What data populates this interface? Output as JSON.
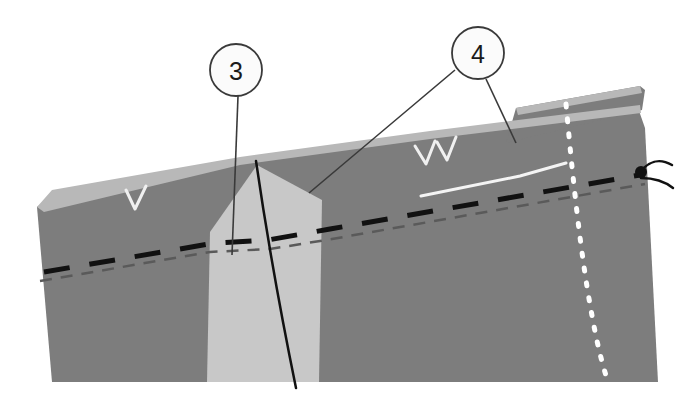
{
  "figure": {
    "type": "geological-cross-section-illustration",
    "background_color": "#ffffff",
    "width": 693,
    "height": 403
  },
  "callouts": [
    {
      "id": "callout-3",
      "label": "3",
      "circle": {
        "cx": 236,
        "cy": 70,
        "r": 26
      },
      "stroke": "#3a3a3a",
      "fill": "#fbfbfb",
      "leaders": [
        {
          "x1": 238,
          "y1": 96,
          "x2": 232,
          "y2": 255
        }
      ]
    },
    {
      "id": "callout-4",
      "label": "4",
      "circle": {
        "cx": 478,
        "cy": 53,
        "r": 26
      },
      "stroke": "#3a3a3a",
      "fill": "#fbfbfb",
      "leaders": [
        {
          "x1": 455,
          "y1": 70,
          "x2": 309,
          "y2": 193
        },
        {
          "x1": 486,
          "y1": 79,
          "x2": 516,
          "y2": 143
        }
      ]
    }
  ],
  "layers": [
    {
      "name": "main-rock-body",
      "color": "#7d7d7d",
      "points": "37,207 55,193 238,160 430,134 638,108 645,128 658,382 118,382 52,382"
    },
    {
      "name": "upper-detached-slab",
      "color": "#7d7d7d",
      "points": "506,143 642,110 645,90 640,86 516,108"
    },
    {
      "name": "top-weathered-crust-main",
      "color": "#b8b8b8",
      "points": "37,207 52,190 240,157 430,131 640,105 641,113 430,139 240,165 44,212"
    },
    {
      "name": "top-weathered-crust-slab",
      "color": "#b8b8b8",
      "points": "516,108 640,86 642,93 518,115"
    },
    {
      "name": "light-wedge-intrusion",
      "color": "#c8c8c8",
      "points": "257,165 322,200 319,382 207,382 210,232"
    }
  ],
  "lines": {
    "bold_black_dashed": {
      "name": "bedding-marker-bold-dashed",
      "color": "#111111",
      "width": 5,
      "dash": "26 20",
      "path": "M 44,272 L 215,243 L 268,240 L 330,229 L 640,175"
    },
    "thin_dark_dashed": {
      "name": "bedding-marker-thin-dashed",
      "color": "#5a5a5a",
      "width": 2.5,
      "dash": "12 9",
      "path": "M 40,281 L 210,252 L 270,249 L 332,239 L 645,184"
    },
    "white_dotted": {
      "name": "white-dotted-fault-trace",
      "color": "#ffffff",
      "width": 5,
      "dash": "3 12",
      "path": "M 566,104 C 572,170 580,250 591,310 C 598,350 604,370 610,388"
    },
    "black_thin_fault": {
      "name": "black-thin-fault-line",
      "color": "#111111",
      "width": 2.5,
      "path": "M 256,161 C 266,230 278,300 296,388"
    },
    "white_bed_separator": {
      "name": "white-bed-separator-line",
      "color": "#f4f4f4",
      "width": 3,
      "path": "M 421,196 L 520,176 L 566,163"
    }
  },
  "markers": {
    "chevrons": [
      {
        "name": "chevron-left",
        "points": "126,190 135,209 146,186"
      },
      {
        "name": "chevron-mid-a",
        "points": "415,146 426,164 435,141"
      },
      {
        "name": "chevron-mid-b",
        "points": "437,142 447,160 456,137"
      }
    ],
    "chevron_color": "#f0f0f0",
    "chevron_width": 3,
    "fault_dot": {
      "name": "fault-hinge-dot",
      "cx": 641,
      "cy": 172,
      "r": 6,
      "color": "#111111"
    },
    "fault_arcs": [
      {
        "name": "fault-arc-upper",
        "path": "M 640,172 C 650,160 660,158 672,165"
      },
      {
        "name": "fault-arc-lower",
        "path": "M 641,178 C 652,178 663,180 673,188"
      }
    ],
    "fault_arc_color": "#111111",
    "fault_arc_width": 2.5
  },
  "colors": {
    "main_gray": "#7d7d7d",
    "light_wedge": "#c8c8c8",
    "crust_gray": "#b8b8b8",
    "ink": "#111111",
    "paper": "#ffffff"
  }
}
